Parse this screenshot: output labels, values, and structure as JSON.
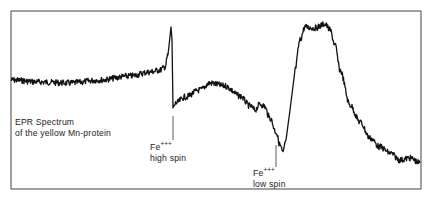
{
  "chart_data": {
    "type": "line",
    "title": "EPR Spectrum of the yellow Mn-protein",
    "xlabel": "",
    "ylabel": "",
    "grid": false,
    "legend": null,
    "frame": {
      "left": 11,
      "top": 11,
      "right": 421,
      "bottom": 189
    },
    "series": [
      {
        "name": "EPR derivative signal",
        "color": "#111111",
        "x": [
          11,
          40,
          70,
          100,
          130,
          150,
          160,
          165,
          168,
          171,
          172,
          173,
          176,
          185,
          200,
          210,
          225,
          240,
          250,
          255,
          260,
          264,
          270,
          276,
          280,
          283,
          286,
          290,
          295,
          300,
          305,
          315,
          325,
          330,
          335,
          340,
          350,
          360,
          370,
          380,
          390,
          400,
          410,
          420
        ],
        "y": [
          80,
          82,
          83,
          80,
          76,
          72,
          70,
          67,
          55,
          27,
          40,
          108,
          103,
          97,
          90,
          83,
          86,
          96,
          106,
          110,
          104,
          106,
          118,
          132,
          145,
          153,
          140,
          110,
          70,
          40,
          27,
          28,
          24,
          30,
          45,
          70,
          105,
          122,
          138,
          147,
          153,
          160,
          158,
          163
        ]
      }
    ],
    "annotations": [
      {
        "text": "Fe+++ high spin",
        "x": 173
      },
      {
        "text": "Fe+++ low spin",
        "x": 283
      }
    ]
  },
  "labels": {
    "title_line1": "EPR Spectrum",
    "title_line2": "of the yellow Mn-protein",
    "fe_high": "Fe",
    "fe_high_sup": "+++",
    "fe_high_spin": "high spin",
    "fe_low": "Fe",
    "fe_low_sup": "+++",
    "fe_low_spin": "low spin"
  }
}
